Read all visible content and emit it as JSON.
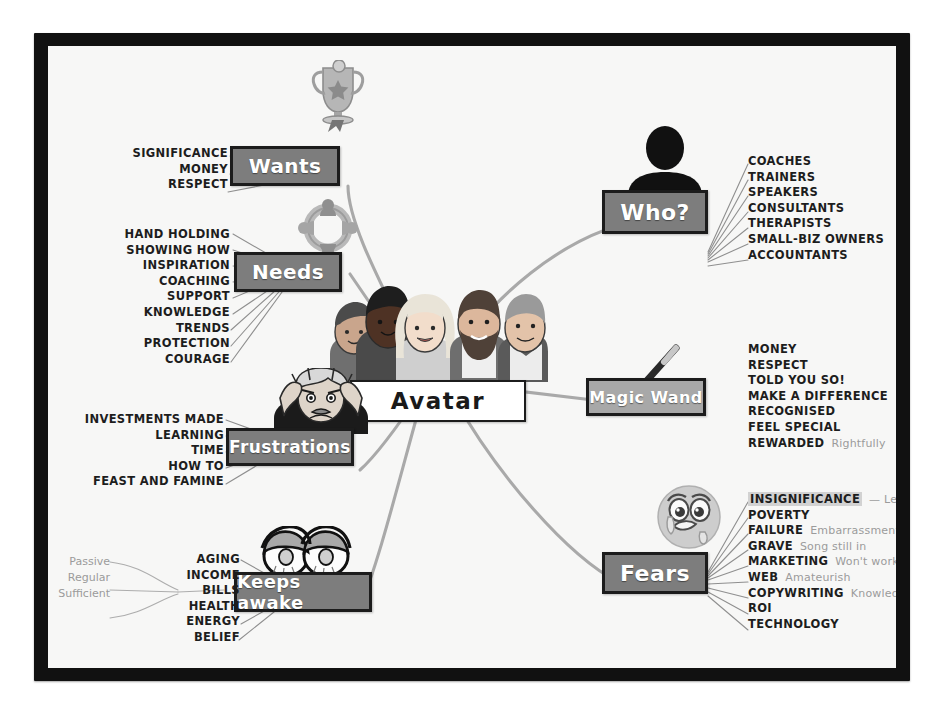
{
  "colors": {
    "frame": "#111111",
    "canvas": "#f7f7f6",
    "node_fill": "#7d7d7d",
    "node_fill_light": "#a8a8a8",
    "node_border": "#1c1c1c",
    "node_text": "#ffffff",
    "center_fill": "#ffffff",
    "center_text": "#1a1a1a",
    "leaf_text": "#1d1d1d",
    "annotation_text": "#9b9b9b",
    "connector": "#a9a9a9",
    "highlight": "#d2d2d2"
  },
  "center": {
    "label": "Avatar",
    "icon": "people-group-icon"
  },
  "branches": [
    {
      "id": "wants",
      "label": "Wants",
      "icon": "trophy-icon",
      "side": "left",
      "items": [
        {
          "text": "SIGNIFICANCE"
        },
        {
          "text": "MONEY"
        },
        {
          "text": "RESPECT"
        }
      ]
    },
    {
      "id": "needs",
      "label": "Needs",
      "icon": "network-people-icon",
      "side": "left",
      "items": [
        {
          "text": "HAND HOLDING"
        },
        {
          "text": "SHOWING HOW"
        },
        {
          "text": "INSPIRATION"
        },
        {
          "text": "COACHING"
        },
        {
          "text": "SUPPORT"
        },
        {
          "text": "KNOWLEDGE"
        },
        {
          "text": "TRENDS"
        },
        {
          "text": "PROTECTION"
        },
        {
          "text": "COURAGE"
        }
      ]
    },
    {
      "id": "frustrations",
      "label": "Frustrations",
      "icon": "stressed-man-icon",
      "side": "left",
      "items": [
        {
          "text": "INVESTMENTS MADE"
        },
        {
          "text": "LEARNING"
        },
        {
          "text": "TIME"
        },
        {
          "text": "HOW TO"
        },
        {
          "text": "FEAST AND FAMINE"
        }
      ]
    },
    {
      "id": "keeps-awake",
      "label": "Keeps awake",
      "icon": "tired-eyes-icon",
      "side": "left",
      "items": [
        {
          "text": "AGING"
        },
        {
          "text": "INCOME"
        },
        {
          "text": "BILLS"
        },
        {
          "text": "HEALTH"
        },
        {
          "text": "ENERGY"
        },
        {
          "text": "BELIEF"
        }
      ],
      "sub_annotations": [
        "Passive",
        "Regular",
        "Sufficient"
      ]
    },
    {
      "id": "who",
      "label": "Who?",
      "icon": "person-silhouette-icon",
      "side": "right",
      "items": [
        {
          "text": "COACHES"
        },
        {
          "text": "TRAINERS"
        },
        {
          "text": "SPEAKERS"
        },
        {
          "text": "CONSULTANTS"
        },
        {
          "text": "THERAPISTS"
        },
        {
          "text": "SMALL-BIZ OWNERS"
        },
        {
          "text": "ACCOUNTANTS"
        }
      ]
    },
    {
      "id": "magic-wand",
      "label": "Magic Wand",
      "icon": "magic-wand-icon",
      "side": "right",
      "light": true,
      "items": [
        {
          "text": "MONEY"
        },
        {
          "text": "RESPECT"
        },
        {
          "text": "TOLD YOU SO!"
        },
        {
          "text": "MAKE A DIFFERENCE"
        },
        {
          "text": "RECOGNISED"
        },
        {
          "text": "FEEL SPECIAL"
        },
        {
          "text": "REWARDED",
          "annotation": "Rightfully"
        }
      ]
    },
    {
      "id": "fears",
      "label": "Fears",
      "icon": "crying-face-icon",
      "side": "right",
      "items": [
        {
          "text": "INSIGNIFICANCE",
          "annotation": "— Legacy",
          "highlight": true
        },
        {
          "text": "POVERTY"
        },
        {
          "text": "FAILURE",
          "annotation": "Embarrassment"
        },
        {
          "text": "GRAVE",
          "annotation": "Song still in"
        },
        {
          "text": "MARKETING",
          "annotation": "Won't work"
        },
        {
          "text": "WEB",
          "annotation": "Amateurish"
        },
        {
          "text": "COPYWRITING",
          "annotation": "Knowledge"
        },
        {
          "text": "ROI"
        },
        {
          "text": "TECHNOLOGY"
        }
      ]
    }
  ]
}
